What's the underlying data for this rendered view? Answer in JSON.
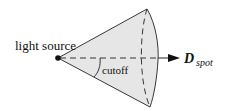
{
  "diagram": {
    "labels": {
      "light_source": "light source",
      "cutoff": "cutoff",
      "direction_main": "D",
      "direction_sub": "spot"
    },
    "colors": {
      "cone_fill": "#e6e6e6",
      "stroke": "#222222",
      "background": "#ffffff"
    }
  }
}
